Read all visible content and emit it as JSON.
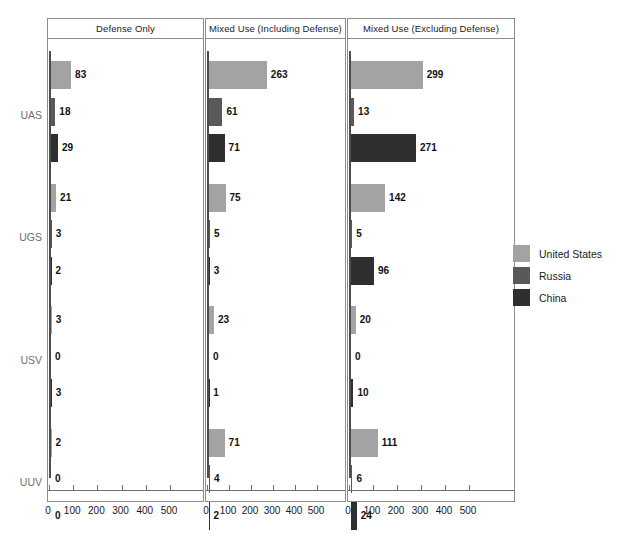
{
  "chart_data": {
    "type": "bar",
    "title": "",
    "subtitle": "",
    "orientation": "horizontal",
    "layout": "faceted-grouped-bar",
    "xlabel": "",
    "ylabel": "",
    "xlim": [
      0,
      550
    ],
    "xticks": [
      0,
      100,
      200,
      300,
      400,
      500
    ],
    "xtick_labels": [
      "0",
      "100",
      "200",
      "300",
      "400",
      "500"
    ],
    "grid": false,
    "legend_position": "right",
    "panels": [
      {
        "title": "Defense Only",
        "groups": [
          {
            "name": "UAS",
            "values": [
              83,
              18,
              29
            ]
          },
          {
            "name": "UGS",
            "values": [
              21,
              3,
              2
            ]
          },
          {
            "name": "USV",
            "values": [
              3,
              0,
              3
            ]
          },
          {
            "name": "UUV",
            "values": [
              2,
              0,
              0
            ]
          }
        ]
      },
      {
        "title": "Mixed Use (Including Defense)",
        "groups": [
          {
            "name": "UAS",
            "values": [
              263,
              61,
              71
            ]
          },
          {
            "name": "UGS",
            "values": [
              75,
              5,
              3
            ]
          },
          {
            "name": "USV",
            "values": [
              23,
              0,
              1
            ]
          },
          {
            "name": "UUV",
            "values": [
              71,
              4,
              2
            ]
          }
        ]
      },
      {
        "title": "Mixed Use (Excluding Defense)",
        "groups": [
          {
            "name": "UAS",
            "values": [
              299,
              13,
              271
            ]
          },
          {
            "name": "UGS",
            "values": [
              142,
              5,
              96
            ]
          },
          {
            "name": "USV",
            "values": [
              20,
              0,
              10
            ]
          },
          {
            "name": "UUV",
            "values": [
              111,
              6,
              24
            ]
          }
        ]
      }
    ],
    "categories": [
      "UAS",
      "UGS",
      "USV",
      "UUV"
    ],
    "series": [
      {
        "name": "United States",
        "color": "#a3a3a3"
      },
      {
        "name": "Russia",
        "color": "#595959"
      },
      {
        "name": "China",
        "color": "#2f2f2f"
      }
    ]
  },
  "legend": {
    "items": [
      {
        "label": "United States",
        "color": "#a3a3a3"
      },
      {
        "label": "Russia",
        "color": "#595959"
      },
      {
        "label": "China",
        "color": "#2f2f2f"
      }
    ]
  },
  "axis": {
    "tick_labels": [
      "0",
      "100",
      "200",
      "300",
      "400",
      "500"
    ]
  }
}
